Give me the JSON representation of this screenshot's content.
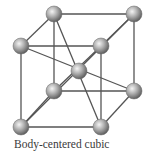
{
  "caption": "Body-centered cubic",
  "colors": {
    "edge": "#555555",
    "atom_light": "#f2f2f2",
    "atom_mid": "#a8a8a8",
    "atom_dark": "#5a5a5a"
  },
  "atoms": [
    {
      "id": "back-top-left",
      "x": 54,
      "y": 14,
      "r": 8
    },
    {
      "id": "back-top-right",
      "x": 134,
      "y": 14,
      "r": 8
    },
    {
      "id": "front-top-left",
      "x": 21,
      "y": 46,
      "r": 8
    },
    {
      "id": "front-top-right",
      "x": 101,
      "y": 46,
      "r": 8
    },
    {
      "id": "body-center",
      "x": 79,
      "y": 71,
      "r": 8
    },
    {
      "id": "back-bottom-left",
      "x": 54,
      "y": 91,
      "r": 8
    },
    {
      "id": "back-bottom-right",
      "x": 134,
      "y": 91,
      "r": 8
    },
    {
      "id": "front-bottom-left",
      "x": 21,
      "y": 127,
      "r": 8
    },
    {
      "id": "front-bottom-right",
      "x": 101,
      "y": 127,
      "r": 8
    }
  ],
  "edges": [
    [
      "back-top-left",
      "back-top-right"
    ],
    [
      "back-top-left",
      "front-top-left"
    ],
    [
      "back-top-right",
      "front-top-right"
    ],
    [
      "front-top-left",
      "front-top-right"
    ],
    [
      "back-bottom-left",
      "back-bottom-right"
    ],
    [
      "back-bottom-left",
      "front-bottom-left"
    ],
    [
      "back-bottom-right",
      "front-bottom-right"
    ],
    [
      "front-bottom-left",
      "front-bottom-right"
    ],
    [
      "back-top-left",
      "back-bottom-left"
    ],
    [
      "back-top-right",
      "back-bottom-right"
    ],
    [
      "front-top-left",
      "front-bottom-left"
    ],
    [
      "front-top-right",
      "front-bottom-right"
    ],
    [
      "front-top-left",
      "back-bottom-right"
    ],
    [
      "back-top-left",
      "front-bottom-right"
    ],
    [
      "back-top-right",
      "front-bottom-left"
    ],
    [
      "front-top-right",
      "back-bottom-left"
    ]
  ]
}
